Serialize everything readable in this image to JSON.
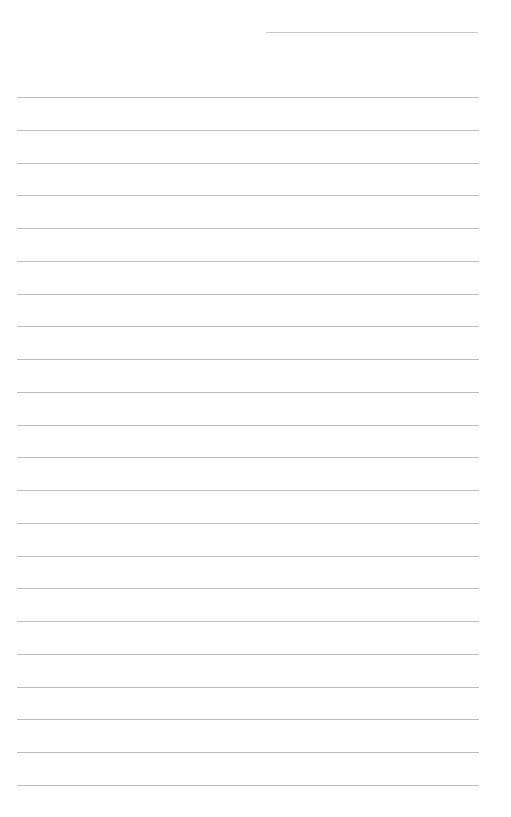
{
  "page": {
    "type": "lined-notepad-page",
    "background": "#ffffff",
    "line_color": "#bdbdbd",
    "header_line": {
      "left": 266,
      "top": 32,
      "width": 212
    },
    "rules": {
      "count": 22,
      "first_top": 97,
      "spacing": 32.76,
      "left": 17,
      "width": 462
    }
  }
}
